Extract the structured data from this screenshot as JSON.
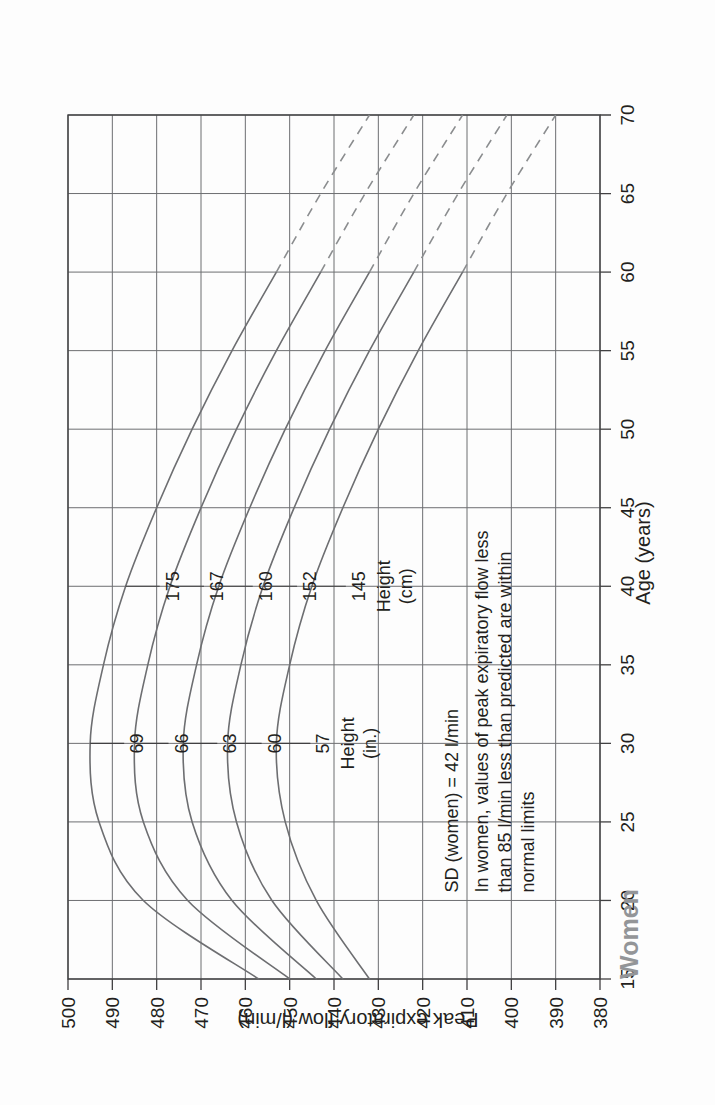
{
  "chart_data": {
    "type": "line",
    "title": "Women",
    "xlabel": "Age (years)",
    "ylabel": "Peak expiratory flow (l/min)",
    "xlim": [
      15,
      70
    ],
    "ylim": [
      380,
      500
    ],
    "xticks": [
      "15",
      "20",
      "25",
      "30",
      "35",
      "40",
      "45",
      "50",
      "55",
      "60",
      "65",
      "70"
    ],
    "yticks": [
      "500",
      "490",
      "480",
      "470",
      "460",
      "450",
      "440",
      "430",
      "420",
      "410",
      "400",
      "390",
      "380"
    ],
    "grid": true,
    "legend_position": "inline-labels",
    "orientation": "rotated-90-ccw",
    "series": [
      {
        "name": "175",
        "height_cm": "175",
        "height_in": "69",
        "x": [
          15,
          20,
          25,
          30,
          35,
          40,
          45,
          50,
          55,
          60,
          65,
          70
        ],
        "values": [
          457,
          483,
          493,
          495,
          492,
          487,
          480,
          472,
          463,
          453,
          443,
          432
        ],
        "solid_until_age": 60
      },
      {
        "name": "167",
        "height_cm": "167",
        "height_in": "66",
        "x": [
          15,
          20,
          25,
          30,
          35,
          40,
          45,
          50,
          55,
          60,
          65,
          70
        ],
        "values": [
          450,
          473,
          483,
          485,
          482,
          477,
          470,
          462,
          453,
          443,
          433,
          422
        ],
        "solid_until_age": 60
      },
      {
        "name": "160",
        "height_cm": "160",
        "height_in": "63",
        "x": [
          15,
          20,
          25,
          30,
          35,
          40,
          45,
          50,
          55,
          60,
          65,
          70
        ],
        "values": [
          444,
          463,
          472,
          474,
          471,
          466,
          459,
          451,
          442,
          432,
          422,
          411
        ],
        "solid_until_age": 60
      },
      {
        "name": "152",
        "height_cm": "152",
        "height_in": "60",
        "x": [
          15,
          20,
          25,
          30,
          35,
          40,
          45,
          50,
          55,
          60,
          65,
          70
        ],
        "values": [
          438,
          454,
          462,
          464,
          461,
          456,
          449,
          441,
          432,
          422,
          412,
          401
        ],
        "solid_until_age": 60
      },
      {
        "name": "145",
        "height_cm": "145",
        "height_in": "57",
        "x": [
          15,
          20,
          25,
          30,
          35,
          40,
          45,
          50,
          55,
          60,
          65,
          70
        ],
        "values": [
          432,
          444,
          451,
          453,
          450,
          445,
          438,
          430,
          421,
          411,
          401,
          390
        ],
        "solid_until_age": 60
      }
    ],
    "annotations": [
      "SD (women) = 42 l/min",
      "In women, values of peak expiratory flow less",
      "than 85 l/min less than predicted are within",
      "normal limits"
    ],
    "height_caption_cm_line1": "Height",
    "height_caption_cm_line2": "(cm)",
    "height_caption_in_line1": "Height",
    "height_caption_in_line2": "(in.)",
    "colors": {
      "curve": "#6d6e71",
      "grid": "#6d6e71",
      "axis": "#414042",
      "text": "#231f20",
      "title": "#939598"
    }
  }
}
